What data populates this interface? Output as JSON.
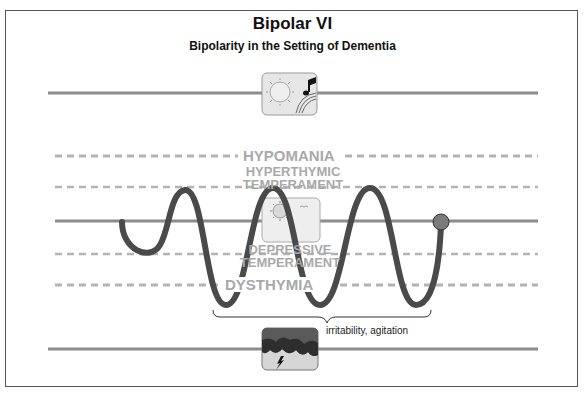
{
  "title": "Bipolar VI",
  "subtitle": "Bipolarity in the Setting of Dementia",
  "levels": {
    "hypomania": "HYPOMANIA",
    "hyperthymic_line1": "HYPERTHYMIC",
    "hyperthymic_line2": "TEMPERAMENT",
    "depressive_line1": "DEPRESSIVE",
    "depressive_line2": "TEMPERAMENT",
    "dysthymia": "DYSTHYMIA"
  },
  "annotation": "irritability, agitation",
  "icons": {
    "top": "sun-and-music-icon",
    "middle": "sun-and-birds-icon",
    "bottom": "storm-cloud-lightning-icon"
  },
  "colors": {
    "solid_line": "#8c8c8c",
    "dashed_line": "#b3b3b3",
    "wave": "#4a4a4a",
    "end_dot": "#7a7a7a",
    "label": "#a9a9a9",
    "icon_bg": "#e6e6e6",
    "cloud": "#3a3a3a"
  }
}
